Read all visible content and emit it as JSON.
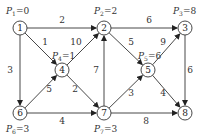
{
  "diagram": {
    "type": "directed-weighted-graph",
    "nodes": [
      {
        "id": "1",
        "x": 20,
        "y": 28,
        "potential": "P1=0",
        "p_label": "P",
        "p_sub": "1",
        "p_val": "=0",
        "lx": 6,
        "ly": 14
      },
      {
        "id": "2",
        "x": 104,
        "y": 28,
        "potential": "P2=2",
        "p_label": "P",
        "p_sub": "2",
        "p_val": "=2",
        "lx": 94,
        "ly": 14
      },
      {
        "id": "3",
        "x": 185,
        "y": 28,
        "potential": "P3=8",
        "p_label": "P",
        "p_sub": "3",
        "p_val": "=8",
        "lx": 173,
        "ly": 14
      },
      {
        "id": "4",
        "x": 62,
        "y": 70,
        "potential": "P4=1",
        "p_label": "P",
        "p_sub": "4",
        "p_val": "=1",
        "lx": 52,
        "ly": 59
      },
      {
        "id": "5",
        "x": 148,
        "y": 70,
        "potential": "P5=6",
        "p_label": "P",
        "p_sub": "5",
        "p_val": "=6",
        "lx": 138,
        "ly": 59
      },
      {
        "id": "6",
        "x": 20,
        "y": 113,
        "potential": "P6=3",
        "p_label": "P",
        "p_sub": "6",
        "p_val": "=3",
        "lx": 6,
        "ly": 132
      },
      {
        "id": "7",
        "x": 104,
        "y": 113,
        "potential": "P7=3",
        "p_label": "P",
        "p_sub": "7",
        "p_val": "=3",
        "lx": 94,
        "ly": 132
      },
      {
        "id": "8",
        "x": 185,
        "y": 113,
        "potential": "",
        "p_label": "",
        "p_sub": "",
        "p_val": "",
        "lx": 0,
        "ly": 0
      }
    ],
    "edges": [
      {
        "from": "1",
        "to": "2",
        "weight": "2",
        "wx": 62,
        "wy": 23
      },
      {
        "from": "1",
        "to": "4",
        "weight": "1",
        "wx": 45,
        "wy": 45
      },
      {
        "from": "1",
        "to": "6",
        "weight": "3",
        "wx": 10,
        "wy": 73
      },
      {
        "from": "4",
        "to": "2",
        "weight": "10",
        "wx": 76,
        "wy": 45
      },
      {
        "from": "6",
        "to": "4",
        "weight": "5",
        "wx": 49,
        "wy": 92
      },
      {
        "from": "4",
        "to": "7",
        "weight": "2",
        "wx": 75,
        "wy": 92
      },
      {
        "from": "7",
        "to": "2",
        "weight": "7",
        "wx": 96,
        "wy": 73
      },
      {
        "from": "2",
        "to": "3",
        "weight": "6",
        "wx": 149,
        "wy": 23
      },
      {
        "from": "2",
        "to": "5",
        "weight": "5",
        "wx": 131,
        "wy": 45
      },
      {
        "from": "5",
        "to": "3",
        "weight": "9",
        "wx": 163,
        "wy": 45
      },
      {
        "from": "3",
        "to": "8",
        "weight": "6",
        "wx": 190,
        "wy": 73
      },
      {
        "from": "6",
        "to": "7",
        "weight": "4",
        "wx": 62,
        "wy": 124
      },
      {
        "from": "7",
        "to": "5",
        "weight": "3",
        "wx": 131,
        "wy": 96
      },
      {
        "from": "5",
        "to": "8",
        "weight": "4",
        "wx": 163,
        "wy": 96
      },
      {
        "from": "7",
        "to": "8",
        "weight": "8",
        "wx": 146,
        "wy": 124
      }
    ]
  }
}
